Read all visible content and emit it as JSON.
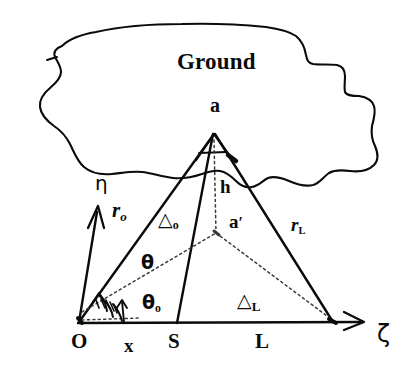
{
  "figure": {
    "kind": "hand-drawn geometry diagram",
    "ink_color": "#0b0b0b",
    "background_color": "#ffffff",
    "labels": {
      "ground": "Ground",
      "apex_point": "a",
      "image_point_base": "a",
      "image_point_prime": "′",
      "height": "h",
      "eta_axis": "η",
      "zeta_axis": "ζ",
      "r_o_base": "r",
      "r_o_sub": "o",
      "r_L_base": "r",
      "r_L_sub": "L",
      "theta": "θ",
      "theta_o_base": "θ",
      "theta_o_sub": "o",
      "delta_o_base": "△",
      "delta_o_sub": "o",
      "delta_L_base": "△",
      "delta_L_sub": "L",
      "origin": "O",
      "x_distance": "x",
      "source_S": "S",
      "length_L": "L"
    }
  }
}
